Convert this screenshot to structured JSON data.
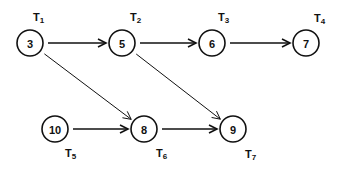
{
  "diagram": {
    "type": "task-graph",
    "nodes": [
      {
        "id": "n3",
        "value": "3",
        "task": "T",
        "sub": "1",
        "cx": 30,
        "cy": 43,
        "lx": 33,
        "ly": 21
      },
      {
        "id": "n5",
        "value": "5",
        "task": "T",
        "sub": "2",
        "cx": 122,
        "cy": 43,
        "lx": 130,
        "ly": 21
      },
      {
        "id": "n6",
        "value": "6",
        "task": "T",
        "sub": "3",
        "cx": 212,
        "cy": 43,
        "lx": 218,
        "ly": 21
      },
      {
        "id": "n7",
        "value": "7",
        "task": "T",
        "sub": "4",
        "cx": 306,
        "cy": 43,
        "lx": 314,
        "ly": 22
      },
      {
        "id": "n10",
        "value": "10",
        "task": "T",
        "sub": "5",
        "cx": 55,
        "cy": 129,
        "lx": 65,
        "ly": 157
      },
      {
        "id": "n8",
        "value": "8",
        "task": "T",
        "sub": "6",
        "cx": 144,
        "cy": 129,
        "lx": 156,
        "ly": 157
      },
      {
        "id": "n9",
        "value": "9",
        "task": "T",
        "sub": "7",
        "cx": 233,
        "cy": 129,
        "lx": 245,
        "ly": 158
      }
    ],
    "edges": [
      {
        "from": "n3",
        "to": "n5",
        "width": 1.6
      },
      {
        "from": "n5",
        "to": "n6",
        "width": 1.6
      },
      {
        "from": "n6",
        "to": "n7",
        "width": 1.6
      },
      {
        "from": "n3",
        "to": "n8",
        "width": 1
      },
      {
        "from": "n5",
        "to": "n9",
        "width": 1
      },
      {
        "from": "n10",
        "to": "n8",
        "width": 1.6
      },
      {
        "from": "n8",
        "to": "n9",
        "width": 1.6
      }
    ],
    "node_radius": 13,
    "colors": {
      "stroke": "#111111",
      "background": "#ffffff"
    }
  }
}
